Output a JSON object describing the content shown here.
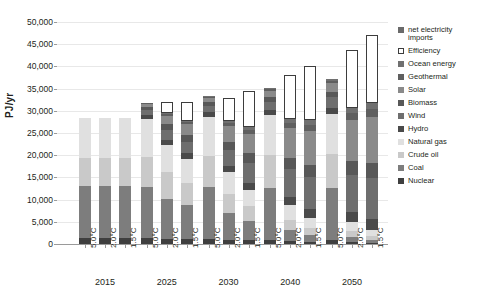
{
  "chart_data": {
    "type": "bar",
    "stacked": true,
    "title": "",
    "xlabel": "",
    "ylabel": "PJ/yr",
    "ylim": [
      0,
      50000
    ],
    "ytick_step": 5000,
    "ytick_labels": [
      "50,000",
      "45,000",
      "40,000",
      "35,000",
      "30,000",
      "25,000",
      "20,000",
      "15,000",
      "10,000",
      "5,000",
      "0"
    ],
    "ytick_values": [
      50000,
      45000,
      40000,
      35000,
      30000,
      25000,
      20000,
      15000,
      10000,
      5000,
      0
    ],
    "grid": true,
    "legend_position": "right",
    "groups": [
      "2015",
      "2025",
      "2030",
      "2040",
      "2050"
    ],
    "scenarios": [
      "5.0°C",
      "2.0°C",
      "1.5°C"
    ],
    "categories": [
      "2015 5.0°C",
      "2015 2.0°C",
      "2015 1.5°C",
      "2025 5.0°C",
      "2025 2.0°C",
      "2025 1.5°C",
      "2030 5.0°C",
      "2030 2.0°C",
      "2030 1.5°C",
      "2040 5.0°C",
      "2040 2.0°C",
      "2040 1.5°C",
      "2050 5.0°C",
      "2050 2.0°C",
      "2050 1.5°C"
    ],
    "series": [
      {
        "name": "Nuclear",
        "color": "#3f3f3f",
        "values": [
          1400,
          1400,
          1400,
          1300,
          1200,
          1100,
          1200,
          1000,
          900,
          900,
          600,
          500,
          800,
          400,
          300
        ]
      },
      {
        "name": "Coal",
        "color": "#7d7d7d",
        "values": [
          11600,
          11600,
          11600,
          11500,
          9000,
          7600,
          11600,
          6000,
          4200,
          11800,
          2600,
          1500,
          11900,
          1200,
          700
        ]
      },
      {
        "name": "Crude oil",
        "color": "#c9c9c9",
        "values": [
          6400,
          6400,
          6400,
          6800,
          6000,
          5000,
          7000,
          4300,
          3400,
          7300,
          2300,
          1600,
          7500,
          1300,
          900
        ]
      },
      {
        "name": "Natural gas",
        "color": "#e0e0e0",
        "values": [
          9100,
          9100,
          9100,
          8600,
          6200,
          5500,
          8900,
          4900,
          3700,
          9000,
          3300,
          2300,
          9100,
          2100,
          1200
        ]
      },
      {
        "name": "Hydro",
        "color": "#4a4a4a",
        "values": [
          0,
          0,
          0,
          900,
          1100,
          1200,
          1000,
          1400,
          1600,
          1200,
          1900,
          2100,
          1400,
          2300,
          2500
        ]
      },
      {
        "name": "Wind",
        "color": "#6e6e6e",
        "values": [
          0,
          0,
          0,
          1100,
          2200,
          2700,
          1400,
          3600,
          4400,
          1900,
          6200,
          7000,
          2400,
          8300,
          9200
        ]
      },
      {
        "name": "Biomass",
        "color": "#585858",
        "values": [
          0,
          0,
          0,
          700,
          1300,
          1500,
          800,
          1900,
          2200,
          1000,
          2600,
          2900,
          1200,
          3100,
          3400
        ]
      },
      {
        "name": "Solar",
        "color": "#8a8a8a",
        "values": [
          0,
          0,
          0,
          600,
          1900,
          2400,
          900,
          3500,
          4500,
          1400,
          6600,
          7600,
          1900,
          9300,
          10400
        ]
      },
      {
        "name": "Geothermal",
        "color": "#5f5f5f",
        "values": [
          0,
          0,
          0,
          200,
          400,
          500,
          300,
          700,
          900,
          400,
          1200,
          1400,
          500,
          1600,
          1900
        ]
      },
      {
        "name": "Ocean energy",
        "color": "#707070",
        "values": [
          0,
          0,
          0,
          100,
          200,
          300,
          200,
          400,
          600,
          300,
          800,
          1000,
          400,
          1100,
          1300
        ]
      },
      {
        "name": "Efficiency",
        "color": "#ffffff",
        "outline": true,
        "values": [
          0,
          0,
          0,
          0,
          2600,
          4200,
          0,
          5100,
          8000,
          0,
          9900,
          12100,
          0,
          13100,
          15200
        ]
      },
      {
        "name": "net electricity imports",
        "color": "#6a6a6a",
        "values": [
          0,
          0,
          0,
          0,
          0,
          0,
          0,
          0,
          0,
          0,
          0,
          0,
          0,
          0,
          0
        ]
      }
    ],
    "totals": [
      28500,
      28500,
      28500,
      31800,
      31800,
      31800,
      34800,
      31800,
      31800,
      41500,
      40500,
      40500,
      45400,
      45100,
      45100
    ]
  },
  "legend": {
    "items": [
      {
        "label": "net electricity\nimports",
        "swatch": "legend-swatch-net-electricity-imports"
      },
      {
        "label": "Efficiency",
        "swatch": "legend-swatch-efficiency"
      },
      {
        "label": "Ocean energy",
        "swatch": "legend-swatch-ocean-energy"
      },
      {
        "label": "Geothermal",
        "swatch": "legend-swatch-geothermal"
      },
      {
        "label": "Solar",
        "swatch": "legend-swatch-solar"
      },
      {
        "label": "Biomass",
        "swatch": "legend-swatch-biomass"
      },
      {
        "label": "Wind",
        "swatch": "legend-swatch-wind"
      },
      {
        "label": "Hydro",
        "swatch": "legend-swatch-hydro"
      },
      {
        "label": "Natural gas",
        "swatch": "legend-swatch-natural-gas"
      },
      {
        "label": "Crude oil",
        "swatch": "legend-swatch-crude-oil"
      },
      {
        "label": "Coal",
        "swatch": "legend-swatch-coal"
      },
      {
        "label": "Nuclear",
        "swatch": "legend-swatch-nuclear"
      }
    ],
    "colors": {
      "net electricity imports": "#6a6a6a",
      "Efficiency": "#ffffff",
      "Ocean energy": "#707070",
      "Geothermal": "#5f5f5f",
      "Solar": "#8a8a8a",
      "Biomass": "#585858",
      "Wind": "#6e6e6e",
      "Hydro": "#4a4a4a",
      "Natural gas": "#e0e0e0",
      "Crude oil": "#c9c9c9",
      "Coal": "#7d7d7d",
      "Nuclear": "#3f3f3f"
    }
  },
  "axis": {
    "y_title": "PJ/yr"
  }
}
